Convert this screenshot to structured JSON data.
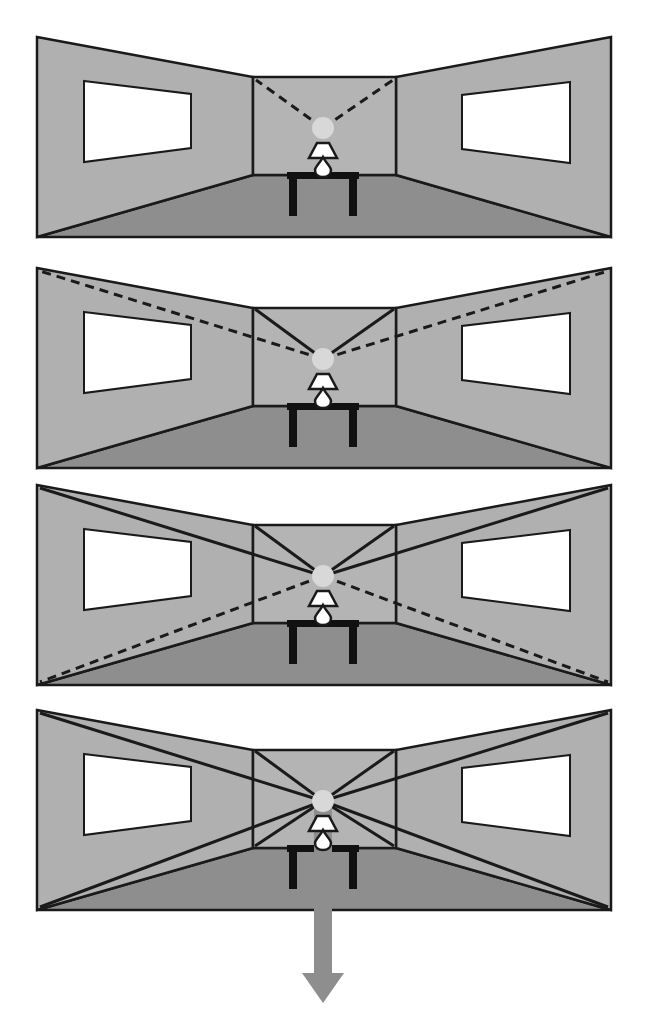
{
  "figure": {
    "background_color": "#ffffff",
    "panel_count": 4
  },
  "palette": {
    "wall_fill": "#b0b0b0",
    "wall_fill_light": "#b4b4b4",
    "floor_fill": "#8e8e8e",
    "window_fill": "#ffffff",
    "outline": "#1a1a1a",
    "lamp_shade_fill": "#ffffff",
    "lamp_base_fill": "#ffffff",
    "table_fill": "#111111",
    "glow_fill": "#d8d8d8",
    "arrow_fill": "#8e8e8e",
    "dashed_line_color": "#1a1a1a",
    "solid_line_color": "#1a1a1a"
  },
  "geometry": {
    "room": {
      "outer_left_x": 37,
      "outer_right_x": 611,
      "outer_top_left_y": 37,
      "outer_top_right_y": 37,
      "outer_bottom_y": 237,
      "back_wall_left_x": 253,
      "back_wall_right_x": 396,
      "back_wall_top_y": 77,
      "back_wall_bottom_y": 175,
      "vanishing_point_x": 323,
      "vanishing_point_y": 128,
      "glow_radius": 11
    },
    "left_window": {
      "near_top_y": 81,
      "near_bottom_y": 162,
      "far_top_y": 94,
      "far_bottom_y": 148,
      "near_x": 84,
      "far_x": 191
    },
    "right_window": {
      "near_x": 462,
      "far_x": 570,
      "near_top_y": 95,
      "near_bottom_y": 149,
      "far_top_y": 82,
      "far_bottom_y": 163
    },
    "table": {
      "left_x": 287,
      "right_x": 359,
      "top_y": 172,
      "top_thickness": 7,
      "leg_width": 8,
      "leg_bottom_y": 216
    },
    "lamp": {
      "shade_top_y": 143,
      "shade_bottom_y": 158,
      "shade_top_half_w": 6,
      "shade_bottom_half_w": 14,
      "base_top_y": 157,
      "base_bottom_y": 172
    },
    "arrow": {
      "shaft_half_width": 9,
      "head_half_width": 21,
      "tip_y": 1003,
      "head_top_y": 973
    }
  },
  "panels": [
    {
      "id": "panel-1",
      "label": "Panel 1 — two dashed convergence lines inside the back wall only",
      "top": 25,
      "height": 225,
      "line_sets": [
        {
          "name": "dashed-to-back-wall-top-corners",
          "style": "dashed",
          "count": 2,
          "targets": [
            "back-wall-top-left",
            "back-wall-top-right"
          ]
        }
      ],
      "has_arrow": false
    },
    {
      "id": "panel-2",
      "label": "Panel 2 — solid lines to back wall top corners plus dashed lines continuing to outer top corners",
      "top": 256,
      "height": 225,
      "line_sets": [
        {
          "name": "solid-to-back-wall-top-corners",
          "style": "solid",
          "count": 2,
          "targets": [
            "back-wall-top-left",
            "back-wall-top-right"
          ]
        },
        {
          "name": "dashed-to-outer-top-corners",
          "style": "dashed",
          "count": 2,
          "targets": [
            "outer-top-left",
            "outer-top-right"
          ]
        }
      ],
      "has_arrow": false
    },
    {
      "id": "panel-3",
      "label": "Panel 3 — solid lines to all top corners plus dashed lines to outer bottom corners",
      "top": 473,
      "height": 225,
      "line_sets": [
        {
          "name": "solid-to-back-wall-top-corners",
          "style": "solid",
          "count": 2,
          "targets": [
            "back-wall-top-left",
            "back-wall-top-right"
          ]
        },
        {
          "name": "solid-to-outer-top-corners",
          "style": "solid",
          "count": 2,
          "targets": [
            "outer-top-left",
            "outer-top-right"
          ]
        },
        {
          "name": "dashed-to-outer-bottom-corners",
          "style": "dashed",
          "count": 2,
          "targets": [
            "outer-bottom-left",
            "outer-bottom-right"
          ]
        }
      ],
      "has_arrow": false
    },
    {
      "id": "panel-4",
      "label": "Panel 4 — all solid convergence lines to every corner, with a downward arrow from the vanishing point",
      "top": 698,
      "height": 335,
      "line_sets": [
        {
          "name": "solid-to-back-wall-top-corners",
          "style": "solid",
          "count": 2,
          "targets": [
            "back-wall-top-left",
            "back-wall-top-right"
          ]
        },
        {
          "name": "solid-to-outer-top-corners",
          "style": "solid",
          "count": 2,
          "targets": [
            "outer-top-left",
            "outer-top-right"
          ]
        },
        {
          "name": "solid-to-back-wall-bottom-corners",
          "style": "solid",
          "count": 2,
          "targets": [
            "back-wall-bottom-left",
            "back-wall-bottom-right"
          ]
        },
        {
          "name": "solid-to-outer-bottom-corners",
          "style": "solid",
          "count": 2,
          "targets": [
            "outer-bottom-left",
            "outer-bottom-right"
          ]
        }
      ],
      "has_arrow": true,
      "arrow_direction": "down"
    }
  ]
}
